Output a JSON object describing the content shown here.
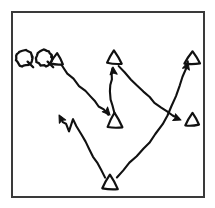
{
  "figure": {
    "title": "Hand-drawn trajectory sketch",
    "caption": "",
    "background_color": "#ffffff",
    "ink_color": "#111111",
    "frame_color": "#3a3a3a",
    "canvas": {
      "width": 215,
      "height": 208
    }
  },
  "frame": {
    "x": 12,
    "y": 12,
    "width": 192,
    "height": 185,
    "stroke_width": 2
  },
  "chart_data": {
    "type": "scatter",
    "title": "Hand-drawn trajectory sketch",
    "xlabel": "",
    "ylabel": "",
    "xlim": [
      12,
      204
    ],
    "ylim": [
      12,
      197
    ],
    "grid": false,
    "legend": "none",
    "markers": [
      {
        "id": "t1",
        "label": "triangle-1",
        "shape": "triangle-outline",
        "x": 57,
        "y": 59,
        "size": 11
      },
      {
        "id": "t2",
        "label": "triangle-2",
        "shape": "triangle-outline",
        "x": 114,
        "y": 58,
        "size": 12
      },
      {
        "id": "t3",
        "label": "triangle-3",
        "shape": "triangle-outline",
        "x": 192,
        "y": 58,
        "size": 12
      },
      {
        "id": "t4",
        "label": "triangle-4",
        "shape": "triangle-outline",
        "x": 115,
        "y": 121,
        "size": 13
      },
      {
        "id": "t5",
        "label": "triangle-5",
        "shape": "triangle-outline",
        "x": 192,
        "y": 120,
        "size": 12
      },
      {
        "id": "t6",
        "label": "triangle-6",
        "shape": "triangle-outline",
        "x": 110,
        "y": 183,
        "size": 13
      }
    ],
    "loop_glyphs": [
      {
        "id": "q1",
        "label": "loop-glyph-1",
        "x": 24,
        "y": 58,
        "radius": 8
      },
      {
        "id": "q2",
        "label": "loop-glyph-2",
        "x": 44,
        "y": 58,
        "radius": 8
      }
    ],
    "paths": [
      {
        "id": "p1",
        "label": "path-triangle1-to-triangle4",
        "from": "t1",
        "to": "t4",
        "arrow_at": "end",
        "points": "61,65 68,73 74,79 79,86 85,91 90,97 95,101 99,106 104,110 108,114"
      },
      {
        "id": "p2",
        "label": "path-triangle4-to-triangle2",
        "from": "t4",
        "to": "t2",
        "arrow_at": "end",
        "points": "114,114 112,106 111,99 110,92 111,85 112,79 112,73 113,68"
      },
      {
        "id": "p3",
        "label": "path-triangle2-to-triangle5",
        "from": "t2",
        "to": "t5",
        "arrow_at": "end",
        "points": "119,66 125,73 131,79 137,86 143,92 149,97 155,103 161,108 167,112 173,116 179,119"
      },
      {
        "id": "p4",
        "label": "path-triangle6-to-triangle3",
        "from": "t6",
        "to": "t3",
        "arrow_at": "end",
        "points": "117,177 124,170 130,163 137,156 143,149 150,142 156,134 162,125 167,116 172,106 176,96 180,86 183,76 186,68 188,62"
      },
      {
        "id": "p5",
        "label": "path-triangle6-to-upper-left",
        "from": "t6",
        "to": "arrow-left",
        "arrow_at": "end",
        "points": "105,177 101,170 97,163 93,156 89,149 85,141 81,134 77,126 73,119 69,131 66,124 63,122 61,118"
      }
    ],
    "arrowheads": [
      {
        "id": "a1",
        "label": "arrowhead-into-triangle4",
        "x": 110,
        "y": 115,
        "angle": 48
      },
      {
        "id": "a2",
        "label": "arrowhead-into-triangle2",
        "x": 113,
        "y": 67,
        "angle": -95
      },
      {
        "id": "a3",
        "label": "arrowhead-into-triangle5",
        "x": 181,
        "y": 120,
        "angle": 22
      },
      {
        "id": "a4",
        "label": "arrowhead-into-triangle3",
        "x": 188,
        "y": 62,
        "angle": -74
      },
      {
        "id": "a5",
        "label": "arrowhead-upper-left",
        "x": 59,
        "y": 115,
        "angle": -118
      }
    ]
  }
}
